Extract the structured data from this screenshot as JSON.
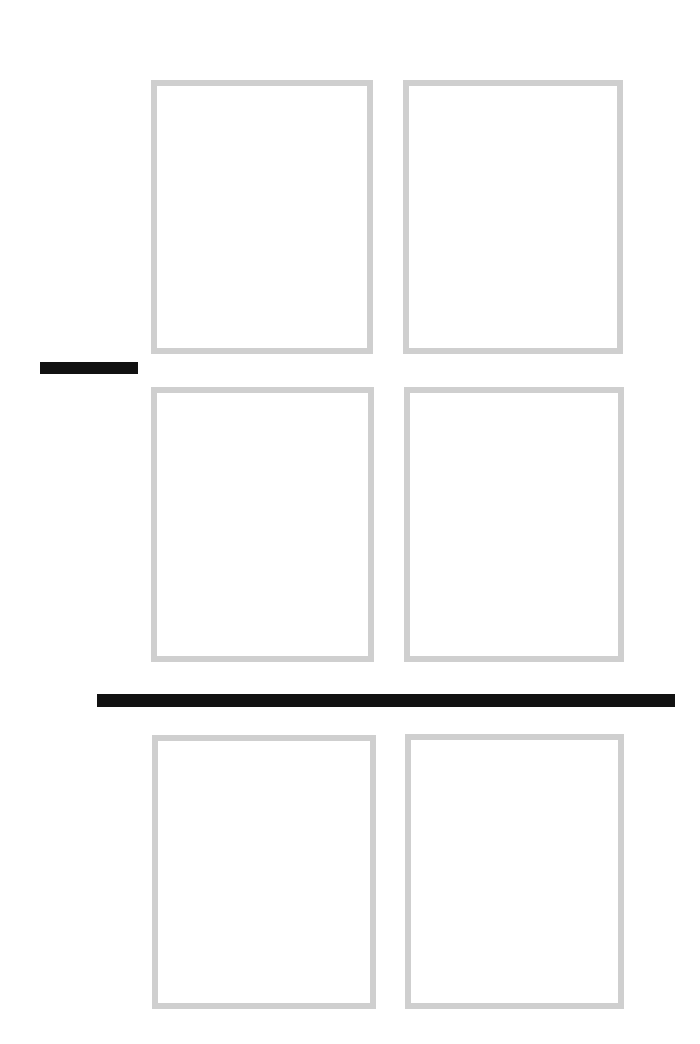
{
  "page": {
    "background": "#ffffff",
    "width": 700,
    "height": 1044
  },
  "frames": [
    {
      "id": "frame-1",
      "row": 1,
      "col": 1,
      "x": 151,
      "y": 80,
      "w": 222,
      "h": 274
    },
    {
      "id": "frame-2",
      "row": 1,
      "col": 2,
      "x": 403,
      "y": 80,
      "w": 220,
      "h": 274
    },
    {
      "id": "frame-3",
      "row": 2,
      "col": 1,
      "x": 151,
      "y": 387,
      "w": 223,
      "h": 275
    },
    {
      "id": "frame-4",
      "row": 2,
      "col": 2,
      "x": 404,
      "y": 387,
      "w": 220,
      "h": 275
    },
    {
      "id": "frame-5",
      "row": 3,
      "col": 1,
      "x": 152,
      "y": 735,
      "w": 224,
      "h": 274
    },
    {
      "id": "frame-6",
      "row": 3,
      "col": 2,
      "x": 405,
      "y": 734,
      "w": 219,
      "h": 275
    }
  ],
  "frame_style": {
    "border_color": "#cfcfcf",
    "border_width": 6
  },
  "bars": [
    {
      "id": "short-bar",
      "x": 40,
      "y": 362,
      "w": 98,
      "h": 12,
      "color": "#111111"
    },
    {
      "id": "long-bar",
      "x": 97,
      "y": 694,
      "w": 578,
      "h": 13,
      "color": "#111111"
    }
  ]
}
